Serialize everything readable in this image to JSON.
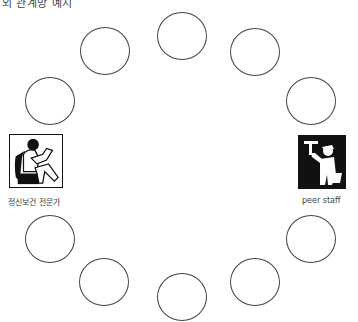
{
  "caption": "외 관계망 예시",
  "nodes": [
    {
      "id": "top",
      "cx": 182,
      "cy": 36
    },
    {
      "id": "upper-right-1",
      "cx": 255,
      "cy": 52
    },
    {
      "id": "upper-right-2",
      "cx": 311,
      "cy": 101
    },
    {
      "id": "lower-right-2",
      "cx": 311,
      "cy": 239
    },
    {
      "id": "lower-right-1",
      "cx": 255,
      "cy": 282
    },
    {
      "id": "bottom",
      "cx": 182,
      "cy": 297
    },
    {
      "id": "lower-left-1",
      "cx": 104,
      "cy": 282
    },
    {
      "id": "lower-left-2",
      "cx": 50,
      "cy": 239
    },
    {
      "id": "upper-left-2",
      "cx": 50,
      "cy": 101
    },
    {
      "id": "upper-left-1",
      "cx": 105,
      "cy": 51
    }
  ],
  "left_person": {
    "label": "정신보건 전문가",
    "icon": "mental-health-professional-icon"
  },
  "right_person": {
    "label": "peer staff",
    "icon": "worker-icon"
  },
  "colors": {
    "stroke": "#444444",
    "icon_dark": "#111111",
    "text": "#444444"
  }
}
